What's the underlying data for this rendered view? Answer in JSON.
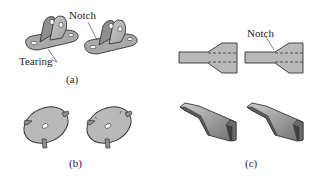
{
  "figure": {
    "panels": [
      {
        "id": "a",
        "caption": "(a)",
        "description": "Two bent sheet-metal brackets with holes; left shows tearing, right shows notch relief",
        "annotations": [
          {
            "text": "Notch",
            "points_to": "right-bracket-bend-relief"
          },
          {
            "text": "Tearing",
            "points_to": "left-bracket-bend-corner"
          }
        ]
      },
      {
        "id": "b",
        "caption": "(b)",
        "description": "Two flat circular washers with a center hole and bent tabs; right has notches at tab roots"
      },
      {
        "id": "c",
        "caption": "(c)",
        "description": "Flat tapered blank layouts with dashed bend lines (top) and formed channel parts (bottom); right blank has a notch",
        "annotations": [
          {
            "text": "Notch",
            "points_to": "right-blank-taper-corner"
          }
        ]
      }
    ],
    "colors": {
      "part_fill": "#b9b9b9",
      "part_shade": "#8e8e8e",
      "outline": "#3a3a3a",
      "background": "#ffffff"
    }
  }
}
